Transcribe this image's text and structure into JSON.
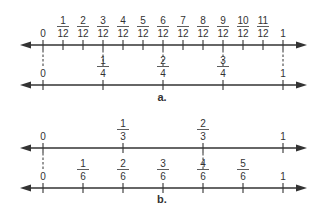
{
  "diagram": {
    "colors": {
      "line": "#333333",
      "text": "#333333",
      "background": "#ffffff"
    },
    "scale": {
      "zero_x": 43,
      "one_x": 283,
      "arrow_left_x": 20,
      "arrow_right_x": 307
    },
    "parts": [
      {
        "label": "a.",
        "label_pos": [
          162,
          101
        ],
        "lines": [
          {
            "y": 45,
            "denominator": 12,
            "labels_above": true,
            "marks": [
              {
                "value": 0,
                "text": "0"
              },
              {
                "value": 1,
                "num": "1",
                "den": "12"
              },
              {
                "value": 2,
                "num": "2",
                "den": "12"
              },
              {
                "value": 3,
                "num": "3",
                "den": "12"
              },
              {
                "value": 4,
                "num": "4",
                "den": "12"
              },
              {
                "value": 5,
                "num": "5",
                "den": "12"
              },
              {
                "value": 6,
                "num": "6",
                "den": "12"
              },
              {
                "value": 7,
                "num": "7",
                "den": "12"
              },
              {
                "value": 8,
                "num": "8",
                "den": "12"
              },
              {
                "value": 9,
                "num": "9",
                "den": "12"
              },
              {
                "value": 10,
                "num": "10",
                "den": "12"
              },
              {
                "value": 11,
                "num": "11",
                "den": "12"
              },
              {
                "value": 12,
                "text": "1"
              }
            ]
          },
          {
            "y": 85,
            "denominator": 4,
            "marks": [
              {
                "value": 0,
                "text": "0"
              },
              {
                "value": 1,
                "num": "1",
                "den": "4"
              },
              {
                "value": 2,
                "num": "2",
                "den": "4"
              },
              {
                "value": 3,
                "num": "3",
                "den": "4"
              },
              {
                "value": 4,
                "text": "1"
              }
            ]
          }
        ],
        "dashed_connectors": [
          0,
          3,
          6,
          9,
          12
        ]
      },
      {
        "label": "b.",
        "label_pos": [
          162,
          203
        ],
        "lines": [
          {
            "y": 148,
            "denominator": 3,
            "marks": [
              {
                "value": 0,
                "text": "0"
              },
              {
                "value": 1,
                "num": "1",
                "den": "3"
              },
              {
                "value": 2,
                "num": "2",
                "den": "3"
              },
              {
                "value": 3,
                "text": "1"
              }
            ]
          },
          {
            "y": 188,
            "denominator": 6,
            "marks": [
              {
                "value": 0,
                "text": "0"
              },
              {
                "value": 1,
                "num": "1",
                "den": "6"
              },
              {
                "value": 2,
                "num": "2",
                "den": "6"
              },
              {
                "value": 3,
                "num": "3",
                "den": "6"
              },
              {
                "value": 4,
                "num": "4",
                "den": "6"
              },
              {
                "value": 5,
                "num": "5",
                "den": "6"
              },
              {
                "value": 6,
                "text": "1"
              }
            ]
          }
        ],
        "dashed_connectors": [
          0,
          2,
          4,
          6
        ]
      }
    ]
  }
}
